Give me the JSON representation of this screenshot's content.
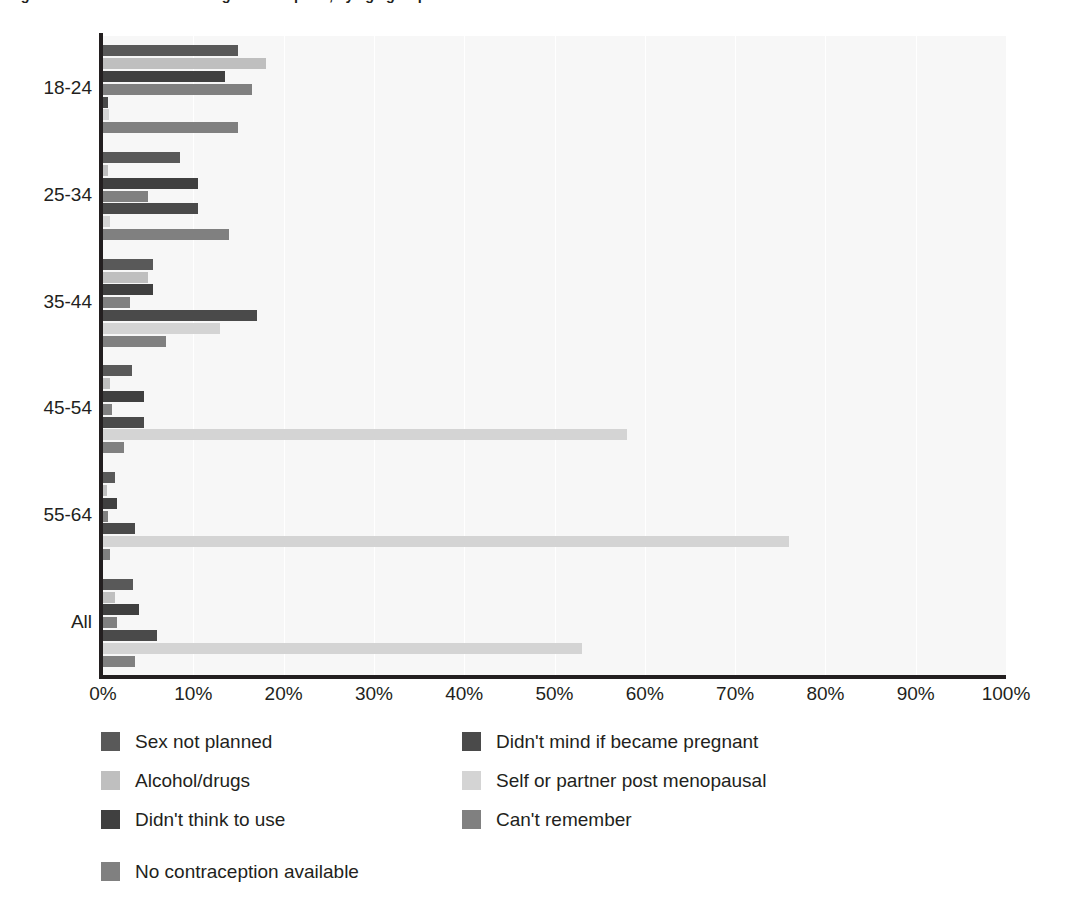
{
  "title": "Figure 4.6 Reasons for not using contraception, by age group",
  "axis": {
    "x_ticks": [
      "0%",
      "10%",
      "20%",
      "30%",
      "40%",
      "50%",
      "60%",
      "70%",
      "80%",
      "90%",
      "100%"
    ],
    "y_categories": [
      "18-24",
      "25-34",
      "35-44",
      "45-54",
      "55-64",
      "All"
    ]
  },
  "legend": {
    "left_column": [
      {
        "label": "Sex not planned",
        "color": "#595959",
        "name": "sex-not-planned"
      },
      {
        "label": "Alcohol/drugs",
        "color": "#bfbfbf",
        "name": "alcohol-drugs"
      },
      {
        "label": "Didn't think to use",
        "color": "#404040",
        "name": "didnt-think-to-use"
      }
    ],
    "right_column": [
      {
        "label": "Didn't mind if became pregnant",
        "color": "#4a4a4a",
        "name": "didnt-mind-pregnant"
      },
      {
        "label": "Self or partner post menopausal",
        "color": "#d4d4d4",
        "name": "post-menopausal"
      },
      {
        "label": "Can't remember",
        "color": "#808080",
        "name": "cant-remember"
      }
    ],
    "extra": [
      {
        "label": "No contraception available",
        "color": "#808080",
        "name": "no-contraception-available"
      }
    ]
  },
  "chart_data": {
    "type": "bar",
    "orientation": "horizontal",
    "title": "Figure 4.6 Reasons for not using contraception, by age group",
    "xlabel": "",
    "ylabel": "",
    "xlim": [
      0,
      100
    ],
    "grid": true,
    "legend_position": "bottom",
    "categories": [
      "18-24",
      "25-34",
      "35-44",
      "45-54",
      "55-64",
      "All"
    ],
    "series": [
      {
        "name": "Sex not planned",
        "color": "#595959",
        "values": [
          15.0,
          8.5,
          5.5,
          3.2,
          1.3,
          3.3
        ]
      },
      {
        "name": "Alcohol/drugs",
        "color": "#bfbfbf",
        "values": [
          18.0,
          0.5,
          5.0,
          0.8,
          0.4,
          1.3
        ]
      },
      {
        "name": "Didn't think to use",
        "color": "#404040",
        "values": [
          13.5,
          10.5,
          5.5,
          4.5,
          1.5,
          4.0
        ]
      },
      {
        "name": "Can't remember",
        "color": "#808080",
        "values": [
          16.5,
          5.0,
          3.0,
          1.0,
          0.6,
          1.6
        ]
      },
      {
        "name": "Didn't mind if became pregnant",
        "color": "#4a4a4a",
        "values": [
          0.5,
          10.5,
          17.0,
          4.5,
          3.5,
          6.0
        ]
      },
      {
        "name": "Self or partner post menopausal",
        "color": "#d4d4d4",
        "values": [
          0.7,
          0.8,
          13.0,
          58.0,
          76.0,
          53.0
        ]
      },
      {
        "name": "No contraception available",
        "color": "#808080",
        "values": [
          15.0,
          14.0,
          7.0,
          2.3,
          0.8,
          3.5
        ]
      }
    ]
  }
}
